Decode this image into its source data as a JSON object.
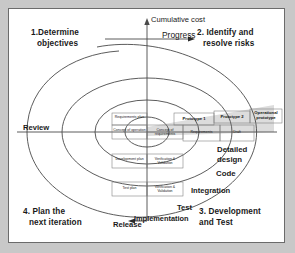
{
  "diagram": {
    "quadrants": [
      {
        "id": "q1",
        "label": "1.Determine\nobjectives"
      },
      {
        "id": "q2",
        "label": "2. Identify and\nresolve risks"
      },
      {
        "id": "q3",
        "label": "3. Development\nand Test"
      },
      {
        "id": "q4",
        "label": "4. Plan the\nnext iteration"
      }
    ],
    "axes": {
      "vertical_label": "Cumulative cost",
      "horizontal_label": "Progress"
    },
    "side_labels": {
      "review": "Review",
      "release": "Release"
    },
    "prototypes": [
      {
        "label": "Prototype 1"
      },
      {
        "label": "Prototype 2"
      },
      {
        "label": "Operational prototype"
      }
    ],
    "plan_cells": [
      {
        "label": "Requirements plan"
      },
      {
        "label": "Concept of operation"
      },
      {
        "label": "Concept of requirements"
      },
      {
        "label": "Requirements"
      },
      {
        "label": "Development plan"
      },
      {
        "label": "Verification & Validation"
      },
      {
        "label": "Test plan"
      },
      {
        "label": "Verification & Validation"
      },
      {
        "label": "Draft"
      }
    ],
    "stages": [
      {
        "label": "Detailed design"
      },
      {
        "label": "Code"
      },
      {
        "label": "Integration"
      },
      {
        "label": "Test"
      },
      {
        "label": "Implementation"
      }
    ],
    "colors": {
      "background": "#c8c8c8",
      "panel": "#ffffff",
      "stroke": "#4a4a4a",
      "text": "#1a1a1a",
      "shade": "#d8d8d8"
    }
  }
}
